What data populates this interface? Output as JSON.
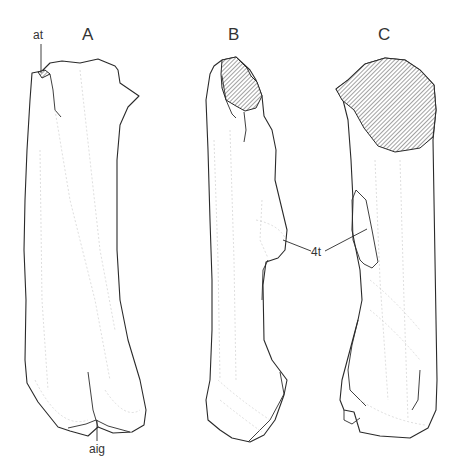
{
  "figure": {
    "panels": [
      {
        "id": "A",
        "label": "A"
      },
      {
        "id": "B",
        "label": "B"
      },
      {
        "id": "C",
        "label": "C"
      }
    ],
    "annotations": {
      "at": "at",
      "aig": "aig",
      "fourth_trochanter": "4t"
    },
    "colors": {
      "line": "#2a2a2a",
      "faint_texture": "#c8c8c8",
      "background": "#ffffff",
      "hatch": "#555555"
    }
  }
}
